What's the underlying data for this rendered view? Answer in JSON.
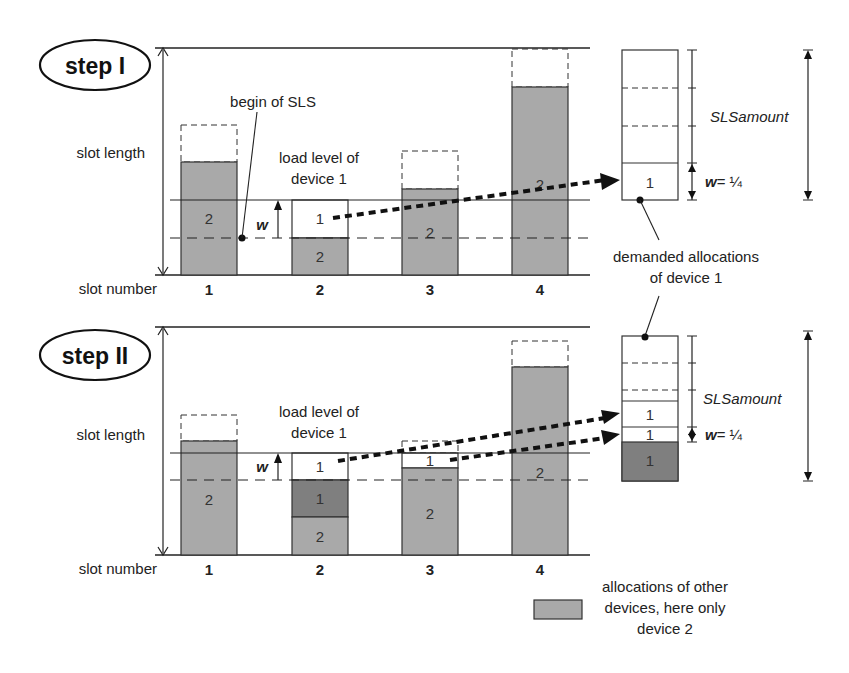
{
  "colors": {
    "other_device_fill": "#a9a9a9",
    "device1_dark_fill": "#7f7f7f",
    "line": "#222222",
    "background": "#ffffff"
  },
  "axis": {
    "slot_length_label": "slot length",
    "slot_number_label": "slot number",
    "slot_numbers": [
      "1",
      "2",
      "3",
      "4"
    ]
  },
  "step1": {
    "title": "step I",
    "begin_label": "begin of SLS",
    "load_level_line1": "load level of",
    "load_level_line2": "device 1",
    "w_label": "w",
    "bar_labels": [
      "2",
      "2",
      "2",
      "2"
    ],
    "device1_label": "1",
    "right_box": {
      "cell_label": "1",
      "w_eq": "w",
      "w_value": "= ¼",
      "amount_label": "SLSamount"
    },
    "demanded_line1": "demanded allocations",
    "demanded_line2": "of device 1"
  },
  "step2": {
    "title": "step II",
    "load_level_line1": "load level of",
    "load_level_line2": "device 1",
    "w_label": "w",
    "bar_labels": [
      "2",
      "2",
      "2",
      "2"
    ],
    "slot2_dark_label": "1",
    "slot2_top_label": "1",
    "slot3_top_label": "1",
    "right_box": {
      "cell_top_label": "1",
      "cell_mid_label": "1",
      "cell_dark_label": "1",
      "w_eq": "w",
      "w_value": "= ¼",
      "amount_label": "SLSamount"
    }
  },
  "legend": {
    "line1": "allocations of other",
    "line2": "devices, here only",
    "line3": "device 2"
  }
}
